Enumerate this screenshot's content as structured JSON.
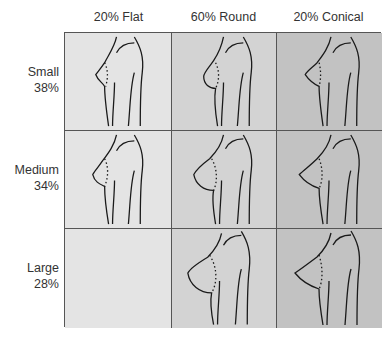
{
  "diagram": {
    "title_fragment": "",
    "columns": [
      {
        "label": "20% Flat",
        "shape": "flat",
        "color": "#e4e4e4"
      },
      {
        "label": "60% Round",
        "shape": "round",
        "color": "#d3d3d3"
      },
      {
        "label": "20% Conical",
        "shape": "conical",
        "color": "#c2c2c2"
      }
    ],
    "rows": [
      {
        "label": "Small",
        "pct": "38%"
      },
      {
        "label": "Medium",
        "pct": "34%"
      },
      {
        "label": "Large",
        "pct": "28%"
      }
    ],
    "cells": [
      [
        {
          "figure": "small-flat"
        },
        {
          "figure": "small-round"
        },
        {
          "figure": "small-conical"
        }
      ],
      [
        {
          "figure": "medium-flat"
        },
        {
          "figure": "medium-round"
        },
        {
          "figure": "medium-conical"
        }
      ],
      [
        {
          "figure": "none"
        },
        {
          "figure": "large-round"
        },
        {
          "figure": "large-conical"
        }
      ]
    ]
  }
}
